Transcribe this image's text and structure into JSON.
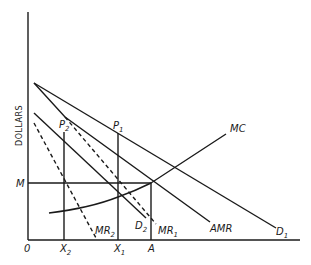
{
  "diagram": {
    "y_axis_label": "DOLLARS",
    "origin_label": "0",
    "y_tick_label": "M",
    "x_ticks": [
      {
        "base": "X",
        "sub": "2"
      },
      {
        "base": "X",
        "sub": "1"
      },
      {
        "base": "A",
        "sub": ""
      }
    ],
    "curves": {
      "D1": {
        "base": "D",
        "sub": "1"
      },
      "D2": {
        "base": "D",
        "sub": "2"
      },
      "MR1": {
        "base": "MR",
        "sub": "1"
      },
      "MR2": {
        "base": "MR",
        "sub": "2"
      },
      "AMR": {
        "base": "AMR",
        "sub": ""
      },
      "MC": {
        "base": "MC",
        "sub": ""
      }
    },
    "points": {
      "P1": {
        "base": "P",
        "sub": "1"
      },
      "P2": {
        "base": "P",
        "sub": "2"
      }
    },
    "colors": {
      "ink": "#1a1a1a",
      "background": "#ffffff"
    }
  }
}
